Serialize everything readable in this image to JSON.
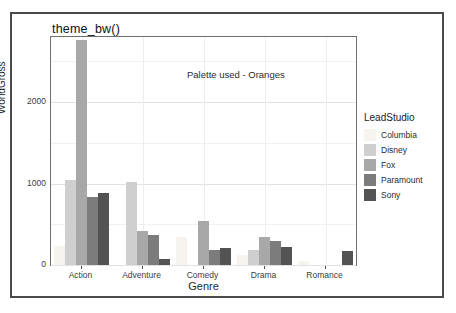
{
  "figure": {
    "title": "theme_bw()",
    "annotation": "Palette used - Oranges"
  },
  "legend": {
    "title": "LeadStudio",
    "entries": [
      {
        "label": "Columbia",
        "color": "#f7f3ef"
      },
      {
        "label": "Disney",
        "color": "#cfcfcf"
      },
      {
        "label": "Fox",
        "color": "#a8a8a8"
      },
      {
        "label": "Paramount",
        "color": "#7c7c7c"
      },
      {
        "label": "Sony",
        "color": "#535353"
      }
    ]
  },
  "chart_data": {
    "type": "bar",
    "title": "theme_bw()",
    "xlabel": "Genre",
    "ylabel": "WorldGross",
    "categories": [
      "Action",
      "Adventure",
      "Comedy",
      "Drama",
      "Romance"
    ],
    "ylim": [
      0,
      2800
    ],
    "yticks": [
      0,
      1000,
      2000
    ],
    "ytick_labels": [
      "0",
      "1000",
      "2000"
    ],
    "grid": true,
    "legend_position": "right",
    "legend_title": "LeadStudio",
    "series": [
      {
        "name": "Columbia",
        "color": "#f7f3ef",
        "values": [
          230,
          0,
          340,
          120,
          55
        ]
      },
      {
        "name": "Disney",
        "color": "#cfcfcf",
        "values": [
          1040,
          1020,
          0,
          185,
          0
        ]
      },
      {
        "name": "Fox",
        "color": "#a8a8a8",
        "values": [
          2760,
          420,
          545,
          340,
          0
        ]
      },
      {
        "name": "Paramount",
        "color": "#7c7c7c",
        "values": [
          830,
          365,
          190,
          300,
          0
        ]
      },
      {
        "name": "Sony",
        "color": "#535353",
        "values": [
          885,
          75,
          205,
          225,
          175
        ]
      }
    ]
  },
  "axes": {
    "y_ticks": [
      "0",
      "1000",
      "2000"
    ],
    "x_ticks": [
      "Action",
      "Adventure",
      "Comedy",
      "Drama",
      "Romance"
    ],
    "y_title": "WorldGross",
    "x_title": "Genre"
  }
}
